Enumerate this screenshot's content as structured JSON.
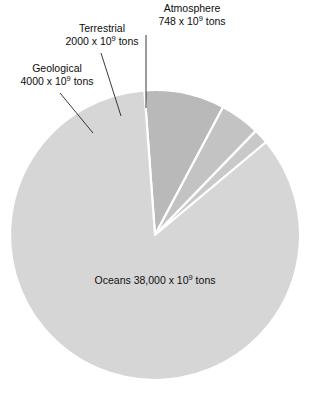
{
  "chart_data": {
    "type": "pie",
    "title": "",
    "subtitle": "",
    "xlabel": "",
    "ylabel": "",
    "legend_position": "none",
    "grid": false,
    "units": "10^9 tons",
    "center": {
      "x": 155,
      "y": 235
    },
    "radius": 145,
    "total": 44748,
    "categories": [
      "Geological",
      "Terrestrial",
      "Atmosphere",
      "Oceans"
    ],
    "values": [
      4000,
      2000,
      748,
      38000
    ],
    "value_labels": [
      "4000 x 10⁹ tons",
      "2000 x 10⁹ tons",
      "748 x 10⁹ tons",
      "38,000 x 10⁹ tons"
    ],
    "percentages": [
      8.94,
      4.47,
      1.67,
      84.92
    ],
    "colors": [
      "#b9b9b9",
      "#c3c3c3",
      "#c9c9c9",
      "#d6d6d6"
    ],
    "slice_edge_color": "#ffffff",
    "slices": [
      {
        "name": "Geological",
        "value": 4000,
        "value_text": "4000 x 10⁹ tons",
        "exponent_base": "4000 x 10",
        "exponent": "9",
        "exponent_tail": " tons",
        "color": "#b9b9b9",
        "start_angle": 265.8,
        "end_angle": 298.0,
        "label_placement": "external",
        "leader_from": {
          "x": 60,
          "y": 93
        },
        "leader_to": {
          "x": 93,
          "y": 133
        }
      },
      {
        "name": "Terrestrial",
        "value": 2000,
        "value_text": "2000 x 10⁹ tons",
        "exponent_base": "2000 x 10",
        "exponent": "9",
        "exponent_tail": " tons",
        "color": "#c3c3c3",
        "start_angle": 298.0,
        "end_angle": 314.1,
        "label_placement": "external",
        "leader_from": {
          "x": 101,
          "y": 53
        },
        "leader_to": {
          "x": 121,
          "y": 116
        }
      },
      {
        "name": "Atmosphere",
        "value": 748,
        "value_text": "748 x 10⁹ tons",
        "exponent_base": "748 x 10",
        "exponent": "9",
        "exponent_tail": " tons",
        "color": "#c9c9c9",
        "start_angle": 314.1,
        "end_angle": 320.1,
        "label_placement": "external",
        "leader_from": {
          "x": 146,
          "y": 35
        },
        "leader_to": {
          "x": 146,
          "y": 108
        }
      },
      {
        "name": "Oceans",
        "value": 38000,
        "value_text": "38,000 x 10⁹ tons",
        "exponent_base": "38,000 x 10",
        "exponent": "9",
        "exponent_tail": " tons",
        "color": "#d6d6d6",
        "start_angle": 320.1,
        "end_angle": 625.8,
        "label_placement": "internal",
        "label_at": {
          "x": 155,
          "y": 287
        }
      }
    ]
  },
  "callouts": {
    "geological": {
      "name": "Geological",
      "value_prefix": "4000 x 10",
      "exponent": "9",
      "value_suffix": " tons"
    },
    "terrestrial": {
      "name": "Terrestrial",
      "value_prefix": "2000 x 10",
      "exponent": "9",
      "value_suffix": " tons"
    },
    "atmosphere": {
      "name": "Atmosphere",
      "value_prefix": "748 x 10",
      "exponent": "9",
      "value_suffix": " tons"
    },
    "oceans": {
      "name": "Oceans",
      "value_prefix": "38,000 x 10",
      "exponent": "9",
      "value_suffix": " tons"
    }
  }
}
